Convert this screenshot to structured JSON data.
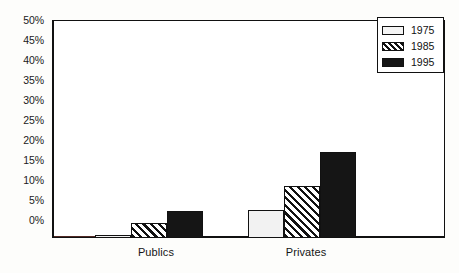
{
  "chart_data": {
    "type": "bar",
    "title": "",
    "subtitle": "",
    "xlabel": "",
    "ylabel": "",
    "categories": [
      "Publics",
      "Privates"
    ],
    "series": [
      {
        "name": "1975",
        "values": [
          0.8,
          6.5
        ],
        "fill": "white-solid",
        "color": "#f2f2f2"
      },
      {
        "name": "1985",
        "values": [
          3.5,
          12.0
        ],
        "fill": "diagonal-hatch",
        "color": "#111111"
      },
      {
        "name": "1995",
        "values": [
          6.3,
          19.8
        ],
        "fill": "black-solid",
        "color": "#151515"
      }
    ],
    "ylim": [
      0,
      50
    ],
    "ytick_step": 5,
    "ytick_labels": [
      "0%",
      "5%",
      "10%",
      "15%",
      "20%",
      "25%",
      "30%",
      "35%",
      "40%",
      "45%",
      "50%"
    ],
    "ytick_values": [
      0,
      5,
      10,
      15,
      20,
      25,
      30,
      35,
      40,
      45,
      50
    ],
    "grid": false,
    "legend_position": "top-right",
    "legend_entries": [
      "1975",
      "1985",
      "1995"
    ],
    "annotations": []
  },
  "axis": {
    "y_labels": [
      "50%",
      "45%",
      "40%",
      "35%",
      "30%",
      "25%",
      "20%",
      "15%",
      "10%",
      "5%",
      "0%"
    ],
    "x_labels": [
      "Publics",
      "Privates"
    ]
  },
  "legend": {
    "items": [
      {
        "label": "1975"
      },
      {
        "label": "1985"
      },
      {
        "label": "1995"
      }
    ]
  }
}
